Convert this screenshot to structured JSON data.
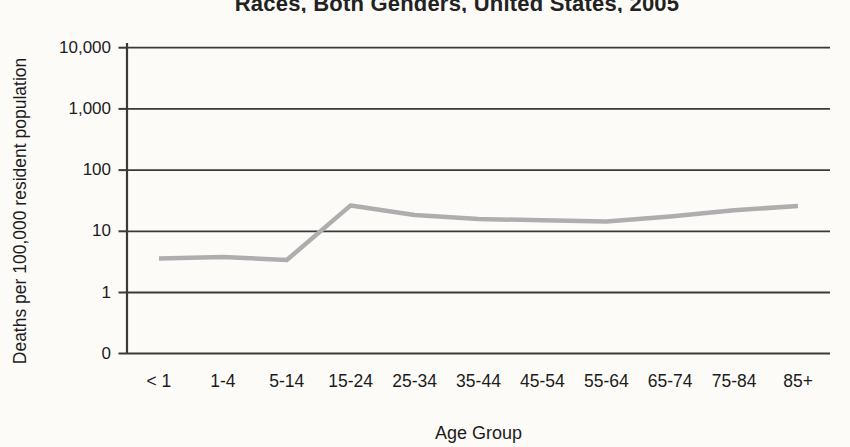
{
  "title": "Races, Both Genders, United States, 2005",
  "chart_data": {
    "type": "line",
    "title": "Races, Both Genders, United States, 2005",
    "xlabel": "Age Group",
    "ylabel": "Deaths per 100,000 resident population",
    "categories": [
      "< 1",
      "1-4",
      "5-14",
      "15-24",
      "25-34",
      "35-44",
      "45-54",
      "55-64",
      "65-74",
      "75-84",
      "85+"
    ],
    "values": [
      3.6,
      3.8,
      3.4,
      26.5,
      18.5,
      15.8,
      15.2,
      14.5,
      17.5,
      22,
      26
    ],
    "y_scale": "log",
    "ylim": [
      0,
      10000
    ],
    "y_ticks": [
      {
        "label": "10,000",
        "value": 10000
      },
      {
        "label": "1,000",
        "value": 1000
      },
      {
        "label": "100",
        "value": 100
      },
      {
        "label": "10",
        "value": 10
      },
      {
        "label": "1",
        "value": 1
      },
      {
        "label": "0",
        "value": 0
      }
    ],
    "grid": true,
    "legend": false,
    "style": {
      "line_color": "#aeaeae",
      "grid_color": "#3a3a3a",
      "text_color": "#1c1c1c",
      "background": "#fcfbf8"
    }
  }
}
